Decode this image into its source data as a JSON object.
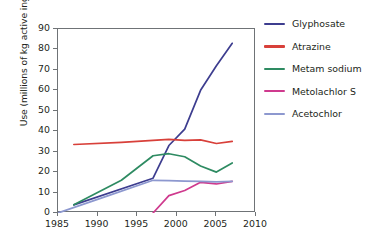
{
  "chart_data": {
    "type": "line",
    "title": "",
    "xlabel": "",
    "ylabel": "Use (millions of kg active ingredient)",
    "xlim": [
      1985,
      2010
    ],
    "ylim": [
      0,
      90
    ],
    "xticks": [
      1985,
      1990,
      1995,
      2000,
      2005,
      2010
    ],
    "yticks": [
      0,
      10,
      20,
      30,
      40,
      50,
      60,
      70,
      80,
      90
    ],
    "grid": false,
    "legend_position": "right",
    "series": [
      {
        "name": "Glyphosate",
        "color": "#3d3d8f",
        "x": [
          1987,
          1997,
          1999,
          2001,
          2003,
          2005,
          2007
        ],
        "values": [
          4,
          17,
          33,
          41,
          60,
          72,
          83
        ]
      },
      {
        "name": "Atrazine",
        "color": "#d8403a",
        "x": [
          1987,
          1993,
          1997,
          1999,
          2001,
          2003,
          2005,
          2007
        ],
        "values": [
          33.5,
          34.5,
          35.5,
          36,
          35.5,
          35.8,
          34,
          35
        ]
      },
      {
        "name": "Metam sodium",
        "color": "#2e8b62",
        "x": [
          1987,
          1993,
          1997,
          1999,
          2001,
          2003,
          2005,
          2007
        ],
        "values": [
          4,
          16,
          28,
          29,
          27.5,
          23,
          20,
          24.5
        ]
      },
      {
        "name": "Metolachlor S",
        "color": "#cf3a8e",
        "x": [
          1997,
          1999,
          2001,
          2003,
          2005,
          2007
        ],
        "values": [
          0,
          8.5,
          11,
          15,
          14.2,
          15.5
        ]
      },
      {
        "name": "Acetochlor",
        "color": "#8d98cf",
        "x": [
          1985,
          1991,
          1997,
          1999,
          2001,
          2003,
          2005,
          2007
        ],
        "values": [
          0,
          8,
          16,
          15.8,
          15.6,
          15.5,
          15.2,
          15.5
        ]
      }
    ]
  },
  "axes": {
    "ytick_labels": [
      "0",
      "10",
      "20",
      "30",
      "40",
      "50",
      "60",
      "70",
      "80",
      "90"
    ],
    "xtick_labels": [
      "1985",
      "1990",
      "1995",
      "2000",
      "2005",
      "2010"
    ]
  }
}
